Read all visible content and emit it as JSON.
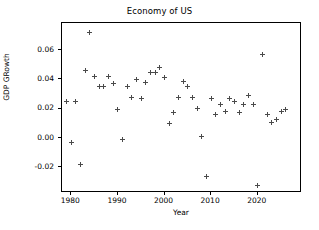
{
  "chart_data": {
    "type": "scatter",
    "title": "Economy of US",
    "xlabel": "Year",
    "ylabel": "GDP GRowth",
    "marker": "+",
    "marker_color": "#4a4a4a",
    "grid": false,
    "legend": null,
    "xlim": [
      1978.0,
      2029.5
    ],
    "ylim": [
      -0.0375,
      0.0785
    ],
    "xticks": [
      1980,
      1990,
      2000,
      2010,
      2020
    ],
    "xtick_labels": [
      "1980",
      "1990",
      "2000",
      "2010",
      "2020"
    ],
    "yticks": [
      -0.02,
      0.0,
      0.02,
      0.04,
      0.06
    ],
    "ytick_labels": [
      "-0.02",
      "0.00",
      "0.02",
      "0.04",
      "0.06"
    ],
    "x": [
      1979,
      1980,
      1981,
      1982,
      1983,
      1984,
      1985,
      1986,
      1987,
      1988,
      1989,
      1990,
      1991,
      1992,
      1993,
      1994,
      1995,
      1996,
      1997,
      1998,
      1999,
      2000,
      2001,
      2002,
      2003,
      2004,
      2005,
      2006,
      2007,
      2008,
      2009,
      2010,
      2011,
      2012,
      2013,
      2014,
      2015,
      2016,
      2017,
      2018,
      2019,
      2020,
      2021,
      2022,
      2023,
      2024,
      2025,
      2026
    ],
    "y": [
      0.0248,
      -0.0028,
      0.0252,
      -0.018,
      0.0458,
      0.0718,
      0.0419,
      0.035,
      0.0351,
      0.0418,
      0.0369,
      0.0192,
      -0.0007,
      0.035,
      0.028,
      0.0401,
      0.0268,
      0.0379,
      0.0445,
      0.0449,
      0.0481,
      0.041,
      0.0101,
      0.0175,
      0.028,
      0.0388,
      0.0351,
      0.028,
      0.02,
      0.0011,
      -0.0259,
      0.0268,
      0.0163,
      0.0231,
      0.0179,
      0.0269,
      0.0249,
      0.0175,
      0.0231,
      0.029,
      0.023,
      -0.0327,
      0.0572,
      0.016,
      0.0105,
      0.0125,
      0.0182,
      0.0193
    ],
    "points": [
      {
        "year": 1979,
        "growth": 0.0248
      },
      {
        "year": 1980,
        "growth": -0.0028
      },
      {
        "year": 1981,
        "growth": 0.0252
      },
      {
        "year": 1982,
        "growth": -0.018
      },
      {
        "year": 1983,
        "growth": 0.0458
      },
      {
        "year": 1984,
        "growth": 0.0718
      },
      {
        "year": 1985,
        "growth": 0.0419
      },
      {
        "year": 1986,
        "growth": 0.035
      },
      {
        "year": 1987,
        "growth": 0.0351
      },
      {
        "year": 1988,
        "growth": 0.0418
      },
      {
        "year": 1989,
        "growth": 0.0369
      },
      {
        "year": 1990,
        "growth": 0.0192
      },
      {
        "year": 1991,
        "growth": -0.0007
      },
      {
        "year": 1992,
        "growth": 0.035
      },
      {
        "year": 1993,
        "growth": 0.028
      },
      {
        "year": 1994,
        "growth": 0.0401
      },
      {
        "year": 1995,
        "growth": 0.0268
      },
      {
        "year": 1996,
        "growth": 0.0379
      },
      {
        "year": 1997,
        "growth": 0.0445
      },
      {
        "year": 1998,
        "growth": 0.0449
      },
      {
        "year": 1999,
        "growth": 0.0481
      },
      {
        "year": 2000,
        "growth": 0.041
      },
      {
        "year": 2001,
        "growth": 0.0101
      },
      {
        "year": 2002,
        "growth": 0.0175
      },
      {
        "year": 2003,
        "growth": 0.028
      },
      {
        "year": 2004,
        "growth": 0.0388
      },
      {
        "year": 2005,
        "growth": 0.0351
      },
      {
        "year": 2006,
        "growth": 0.028
      },
      {
        "year": 2007,
        "growth": 0.02
      },
      {
        "year": 2008,
        "growth": 0.0011
      },
      {
        "year": 2009,
        "growth": -0.0259
      },
      {
        "year": 2010,
        "growth": 0.0268
      },
      {
        "year": 2011,
        "growth": 0.0163
      },
      {
        "year": 2012,
        "growth": 0.0231
      },
      {
        "year": 2013,
        "growth": 0.0179
      },
      {
        "year": 2014,
        "growth": 0.0269
      },
      {
        "year": 2015,
        "growth": 0.0249
      },
      {
        "year": 2016,
        "growth": 0.0175
      },
      {
        "year": 2017,
        "growth": 0.0231
      },
      {
        "year": 2018,
        "growth": 0.029
      },
      {
        "year": 2019,
        "growth": 0.023
      },
      {
        "year": 2020,
        "growth": -0.0327
      },
      {
        "year": 2021,
        "growth": 0.0572
      },
      {
        "year": 2022,
        "growth": 0.016
      },
      {
        "year": 2023,
        "growth": 0.0105
      },
      {
        "year": 2024,
        "growth": 0.0125
      },
      {
        "year": 2025,
        "growth": 0.0182
      },
      {
        "year": 2026,
        "growth": 0.0193
      }
    ]
  }
}
